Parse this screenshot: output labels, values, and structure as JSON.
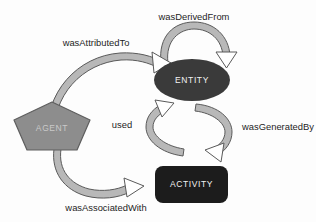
{
  "diagram": {
    "type": "node-link-diagram",
    "background_color": "#fdfdfd",
    "nodes": [
      {
        "id": "entity",
        "label": "ENTITY",
        "shape": "ellipse",
        "fill_color": "#3a3a3a",
        "text_color": "#f2f2f2",
        "cx": 192,
        "cy": 80,
        "rx": 38,
        "ry": 21
      },
      {
        "id": "agent",
        "label": "AGENT",
        "shape": "pentagon",
        "fill_color": "#8d8d8d",
        "stroke_color": "#5e5e5e",
        "text_color": "#c9c9c9",
        "cx": 52,
        "cy": 127,
        "radius": 25
      },
      {
        "id": "activity",
        "label": "ACTIVITY",
        "shape": "rounded-rect",
        "fill_color": "#1c1c1c",
        "text_color": "#f2f2f2",
        "x": 155,
        "y": 166,
        "width": 73,
        "height": 37,
        "corner_radius": 8
      }
    ],
    "edges": [
      {
        "id": "was-derived-from",
        "label": "wasDerivedFrom",
        "from": "entity",
        "to": "entity",
        "kind": "self-loop",
        "label_x": 194,
        "label_y": 18,
        "label_anchor": "middle"
      },
      {
        "id": "was-attributed-to",
        "label": "wasAttributedTo",
        "from": "entity",
        "to": "agent",
        "kind": "curve",
        "label_x": 96,
        "label_y": 44,
        "label_anchor": "middle"
      },
      {
        "id": "used",
        "label": "used",
        "from": "activity",
        "to": "entity",
        "kind": "curve",
        "label_x": 122,
        "label_y": 126,
        "label_anchor": "middle"
      },
      {
        "id": "was-generated-by",
        "label": "wasGeneratedBy",
        "from": "entity",
        "to": "activity",
        "kind": "curve",
        "label_x": 242,
        "label_y": 128,
        "label_anchor": "start"
      },
      {
        "id": "was-associated-with",
        "label": "wasAssociatedWith",
        "from": "activity",
        "to": "agent",
        "kind": "curve",
        "label_x": 106,
        "label_y": 209,
        "label_anchor": "middle"
      }
    ],
    "arrow_style": {
      "fill_color": "#b8b8b8",
      "stroke_color": "#5a5a5a",
      "head_fill_color": "#ffffff"
    }
  }
}
